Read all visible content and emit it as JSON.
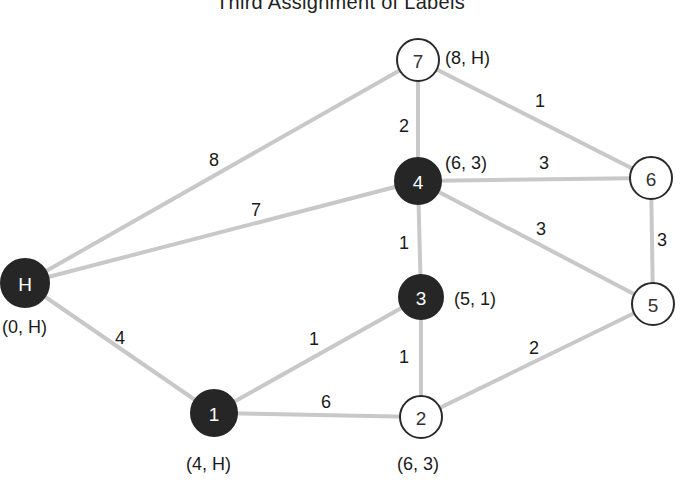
{
  "title": "Third Assignment of Labels",
  "colors": {
    "edge": "#c8c8c8",
    "permanent_node_fill": "#262626",
    "temporary_node_fill": "#ffffff",
    "node_stroke": "#2a2a2a"
  },
  "nodes": [
    {
      "id": "H",
      "label": "H",
      "x": 25,
      "y": 283,
      "r": 24,
      "permanent": true,
      "tag": "(0, H)",
      "tag_x": 2,
      "tag_y": 327,
      "tag_anchor": "start"
    },
    {
      "id": "1",
      "label": "1",
      "x": 214,
      "y": 413,
      "r": 23,
      "permanent": true,
      "tag": "(4, H)",
      "tag_x": 186,
      "tag_y": 464,
      "tag_anchor": "start"
    },
    {
      "id": "2",
      "label": "2",
      "x": 421,
      "y": 417,
      "r": 21,
      "permanent": false,
      "tag": "(6, 3)",
      "tag_x": 397,
      "tag_y": 464,
      "tag_anchor": "start"
    },
    {
      "id": "3",
      "label": "3",
      "x": 421,
      "y": 297,
      "r": 22,
      "permanent": true,
      "tag": "(5, 1)",
      "tag_x": 454,
      "tag_y": 299,
      "tag_anchor": "start"
    },
    {
      "id": "4",
      "label": "4",
      "x": 418,
      "y": 181,
      "r": 23,
      "permanent": true,
      "tag": "(6, 3)",
      "tag_x": 445,
      "tag_y": 163,
      "tag_anchor": "start"
    },
    {
      "id": "5",
      "label": "5",
      "x": 653,
      "y": 304,
      "r": 21,
      "permanent": false,
      "tag": "",
      "tag_x": 0,
      "tag_y": 0,
      "tag_anchor": "start"
    },
    {
      "id": "6",
      "label": "6",
      "x": 651,
      "y": 178,
      "r": 21,
      "permanent": false,
      "tag": "",
      "tag_x": 0,
      "tag_y": 0,
      "tag_anchor": "start"
    },
    {
      "id": "7",
      "label": "7",
      "x": 418,
      "y": 60,
      "r": 21,
      "permanent": false,
      "tag": "(8, H)",
      "tag_x": 445,
      "tag_y": 58,
      "tag_anchor": "start"
    }
  ],
  "edges": [
    {
      "from": "H",
      "to": "7",
      "weight": "8",
      "lx": 214,
      "ly": 160
    },
    {
      "from": "H",
      "to": "4",
      "weight": "7",
      "lx": 256,
      "ly": 210
    },
    {
      "from": "H",
      "to": "1",
      "weight": "4",
      "lx": 120,
      "ly": 338
    },
    {
      "from": "1",
      "to": "3",
      "weight": "1",
      "lx": 314,
      "ly": 339
    },
    {
      "from": "1",
      "to": "2",
      "weight": "6",
      "lx": 326,
      "ly": 402
    },
    {
      "from": "3",
      "to": "2",
      "weight": "1",
      "lx": 404,
      "ly": 357
    },
    {
      "from": "4",
      "to": "3",
      "weight": "1",
      "lx": 404,
      "ly": 243
    },
    {
      "from": "7",
      "to": "4",
      "weight": "2",
      "lx": 404,
      "ly": 126
    },
    {
      "from": "7",
      "to": "6",
      "weight": "1",
      "lx": 540,
      "ly": 101
    },
    {
      "from": "4",
      "to": "6",
      "weight": "3",
      "lx": 544,
      "ly": 163
    },
    {
      "from": "4",
      "to": "5",
      "weight": "3",
      "lx": 541,
      "ly": 229
    },
    {
      "from": "6",
      "to": "5",
      "weight": "3",
      "lx": 662,
      "ly": 240
    },
    {
      "from": "2",
      "to": "5",
      "weight": "2",
      "lx": 534,
      "ly": 348
    }
  ]
}
